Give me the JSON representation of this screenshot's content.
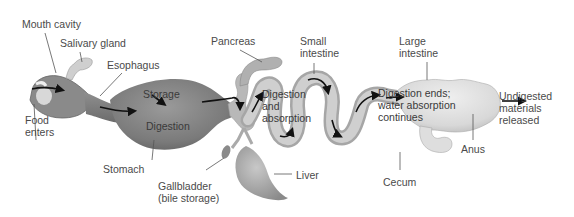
{
  "diagram": {
    "labels": {
      "mouth_cavity": "Mouth cavity",
      "salivary_gland": "Salivary gland",
      "esophagus": "Esophagus",
      "food_enters_1": "Food",
      "food_enters_2": "enters",
      "stomach": "Stomach",
      "storage": "Storage",
      "digestion": "Digestion",
      "pancreas": "Pancreas",
      "gallbladder_1": "Gallbladder",
      "gallbladder_2": "(bile storage)",
      "liver": "Liver",
      "small_intestine_1": "Small",
      "small_intestine_2": "intestine",
      "digestion_absorption_1": "Digestion",
      "digestion_absorption_2": "and",
      "digestion_absorption_3": "absorption",
      "large_intestine_1": "Large",
      "large_intestine_2": "intestine",
      "digestion_ends_1": "Digestion ends;",
      "digestion_ends_2": "water absorption",
      "digestion_ends_3": "continues",
      "cecum": "Cecum",
      "anus": "Anus",
      "undigested_1": "Undigested",
      "undigested_2": "materials",
      "undigested_3": "released"
    },
    "colors": {
      "stomach_dark": "#6e6e6e",
      "stomach_mid": "#8c8c8c",
      "intestine": "#bdbdbd",
      "intestine_light": "#d8d8d8",
      "large_intestine": "#dcdcdc",
      "arrow": "#111111",
      "leader_line": "#555555",
      "text": "#4a4a4a"
    }
  }
}
